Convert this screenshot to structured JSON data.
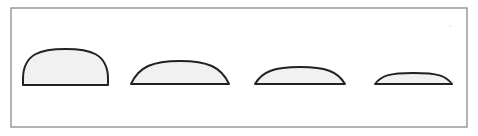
{
  "diagram": {
    "type": "sessile-droplet-profiles",
    "frame": {
      "x": 11,
      "y": 8,
      "width": 456,
      "height": 119,
      "stroke": "#8a8a8a"
    },
    "fill_color": "#f1f1f1",
    "outline_color": "#222222",
    "shapes": [
      {
        "label": "cap-1",
        "x1": 23,
        "x2": 108,
        "top": 49,
        "base": 85,
        "shape": "tall"
      },
      {
        "label": "cap-2",
        "x1": 131,
        "x2": 229,
        "top": 61,
        "base": 84,
        "shape": "medium"
      },
      {
        "label": "cap-3",
        "x1": 255,
        "x2": 345,
        "top": 67,
        "base": 84,
        "shape": "low"
      },
      {
        "label": "cap-4",
        "x1": 375,
        "x2": 452,
        "top": 73,
        "base": 84,
        "shape": "flat"
      }
    ]
  }
}
